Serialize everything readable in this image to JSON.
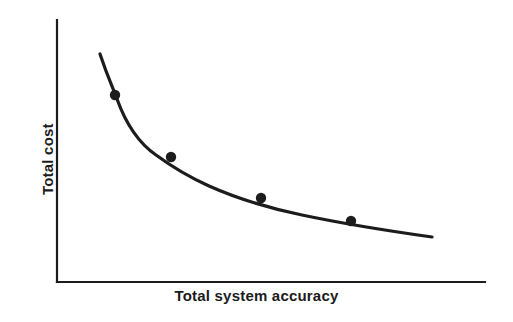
{
  "figure": {
    "kind": "line-chart",
    "background_color": "#ffffff",
    "ink_color": "#1c1c1c"
  },
  "axes": {
    "x_label": "Total system accuracy",
    "y_label": "Total cost",
    "x_axis_line": {
      "x1": 57,
      "y1": 282,
      "x2": 485,
      "y2": 282
    },
    "y_axis_line": {
      "x1": 57,
      "y1": 20,
      "x2": 57,
      "y2": 282
    },
    "axis_stroke_width": 2.2,
    "ticks": [],
    "tick_labels": [],
    "grid": false
  },
  "chart_data": {
    "type": "line",
    "title": "",
    "subtitle": "",
    "xlabel": "Total system accuracy",
    "ylabel": "Total cost",
    "xlim": [
      0,
      1
    ],
    "ylim": [
      0,
      1
    ],
    "grid": false,
    "legend": null,
    "axis_tick_labels": {
      "x": [],
      "y": []
    },
    "annotations": [],
    "series": [
      {
        "name": "Total cost vs total system accuracy",
        "line_color": "#1c1c1c",
        "line_width": 3.2,
        "marker": "filled-circle",
        "marker_size": 5.2,
        "x": [
          0.13,
          0.3,
          0.54,
          0.78
        ],
        "y": [
          0.715,
          0.478,
          0.32,
          0.233
        ],
        "points_px": [
          {
            "x": 115,
            "y": 95
          },
          {
            "x": 171,
            "y": 157
          },
          {
            "x": 261,
            "y": 198
          },
          {
            "x": 351,
            "y": 221
          }
        ],
        "curve_px": {
          "start": {
            "x": 100,
            "y": 54
          },
          "end": {
            "x": 432,
            "y": 237
          },
          "path": "M 100 54 C 108 78 113 88 117 99 C 126 124 140 144 156 155 C 171 166 189 177 209 186 C 236 198 268 208 302 215 C 340 223 389 231 432 237"
        }
      }
    ]
  }
}
